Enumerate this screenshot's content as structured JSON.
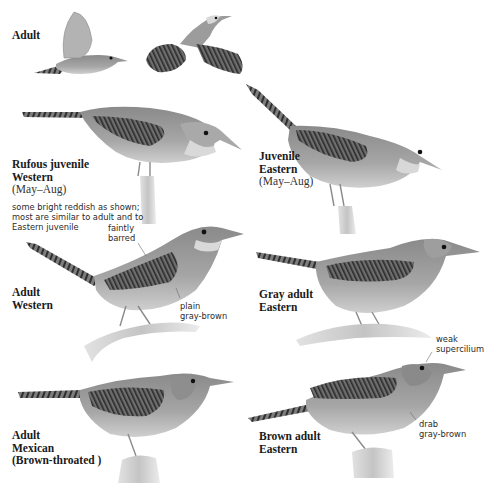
{
  "plate": {
    "subject": "House Wren variations",
    "background_color": "#ffffff",
    "bird_body_color": "#8f8f8f",
    "bird_belly_color": "#c9c9c9",
    "bar_color": "#3a3a3a"
  },
  "figures": [
    {
      "id": "adult-flight",
      "name": "Adult",
      "season": ""
    },
    {
      "id": "rufous-juvenile-western",
      "name_line1": "Rufous juvenile",
      "name_line2": "Western",
      "season": "(May–Aug)",
      "note_lines": [
        "some bright reddish as shown;",
        "most are similar to adult and to",
        "Eastern juvenile"
      ]
    },
    {
      "id": "juvenile-eastern",
      "name_line1": "Juvenile",
      "name_line2": "Eastern",
      "season": "(May–Aug)"
    },
    {
      "id": "adult-western",
      "name_line1": "Adult",
      "name_line2": "Western",
      "callouts": [
        {
          "line1": "faintly",
          "line2": "barred"
        },
        {
          "line1": "plain",
          "line2": "gray-brown"
        }
      ]
    },
    {
      "id": "gray-adult-eastern",
      "name_line1": "Gray adult",
      "name_line2": "Eastern"
    },
    {
      "id": "adult-mexican",
      "name_line1": "Adult",
      "name_line2": "Mexican",
      "name_line3": "(Brown-throated )"
    },
    {
      "id": "brown-adult-eastern",
      "name_line1": "Brown adult",
      "name_line2": "Eastern",
      "callouts": [
        {
          "line1": "weak",
          "line2": "supercilium"
        },
        {
          "line1": "drab",
          "line2": "gray-brown"
        }
      ]
    }
  ]
}
